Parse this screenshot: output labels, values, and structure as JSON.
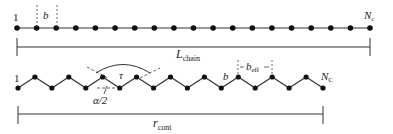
{
  "diagram": {
    "top_chain": {
      "description": "Fully extended chain of beads",
      "num_beads_drawn": 19,
      "start_label": "1",
      "end_label": {
        "main": "N",
        "sub": "c"
      },
      "bond_label": "b",
      "length_label": {
        "main": "L",
        "sub": "chain"
      }
    },
    "bottom_chain": {
      "description": "Zigzag (planar) chain conformation",
      "num_beads_drawn": 19,
      "start_label": "1",
      "end_label": {
        "main": "N",
        "sub": "C"
      },
      "bond_label": "b",
      "effective_bond_label": {
        "main": "b",
        "sub": "eff"
      },
      "torsion_label": "τ",
      "angle_label": "α/2",
      "length_label": {
        "main": "r",
        "sub": "cont"
      }
    },
    "colors": {
      "line": "#333333",
      "bead": "#111111",
      "dash": "#555555"
    }
  }
}
